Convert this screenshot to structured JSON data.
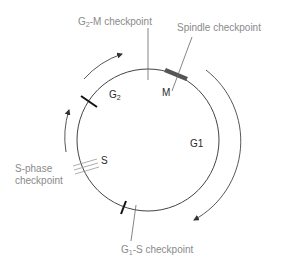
{
  "diagram": {
    "type": "cell-cycle",
    "phases": [
      {
        "id": "g2",
        "label": "G",
        "sub": "2"
      },
      {
        "id": "m",
        "label": "M"
      },
      {
        "id": "g1",
        "label": "G1"
      },
      {
        "id": "s",
        "label": "S"
      }
    ],
    "checkpoints": {
      "g2m": {
        "prefix": "G",
        "sub": "2",
        "suffix": "-M checkpoint"
      },
      "spindle": {
        "label": "Spindle checkpoint"
      },
      "sphase": {
        "line1": "S-phase",
        "line2": "checkpoint"
      },
      "g1s": {
        "prefix": "G",
        "sub": "1",
        "suffix": "-S checkpoint"
      }
    },
    "colors": {
      "label_gray": "#8a8a8a",
      "phase_dark": "#2a2a2a",
      "circle": "#444444",
      "mitosis_bar": "#555555"
    }
  }
}
